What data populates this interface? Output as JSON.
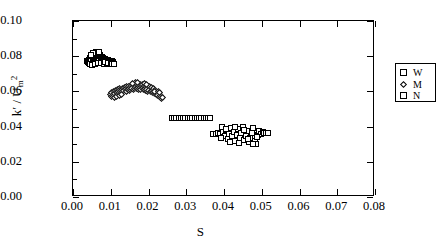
{
  "chart_data": {
    "type": "scatter",
    "title": "",
    "xlabel": "S",
    "ylabel": "k' / U_m^2",
    "ylabel_parts": {
      "symbol": "k",
      "prime": "′",
      "separator": " / ",
      "denom": "U",
      "denom_sub": "m",
      "denom_sup": "2"
    },
    "xlim": [
      0.0,
      0.08
    ],
    "ylim": [
      0.0,
      0.1
    ],
    "xticks": [
      0.0,
      0.01,
      0.02,
      0.03,
      0.04,
      0.05,
      0.06,
      0.07,
      0.08
    ],
    "xtick_labels": [
      "0.00",
      "0.01",
      "0.02",
      "0.03",
      "0.04",
      "0.05",
      "0.06",
      "0.07",
      "0.08"
    ],
    "yticks": [
      0.0,
      0.02,
      0.04,
      0.06,
      0.08,
      0.1
    ],
    "ytick_labels": [
      "0.00",
      "0.02",
      "0.04",
      "0.06",
      "0.08",
      "0.10"
    ],
    "grid": false,
    "legend_position": "upper right",
    "legend": [
      {
        "label": "W",
        "marker": "square"
      },
      {
        "label": "M",
        "marker": "diamond"
      },
      {
        "label": "N",
        "marker": "square"
      }
    ],
    "series": [
      {
        "name": "W",
        "marker": "square",
        "points": [
          [
            0.0038,
            0.0772
          ],
          [
            0.004,
            0.0768
          ],
          [
            0.0042,
            0.078
          ],
          [
            0.0043,
            0.0762
          ],
          [
            0.0045,
            0.0788
          ],
          [
            0.0046,
            0.0775
          ],
          [
            0.0048,
            0.0795
          ],
          [
            0.0049,
            0.0783
          ],
          [
            0.0051,
            0.08
          ],
          [
            0.0052,
            0.079
          ],
          [
            0.0053,
            0.0806
          ],
          [
            0.0055,
            0.0797
          ],
          [
            0.0056,
            0.0812
          ],
          [
            0.0057,
            0.0802
          ],
          [
            0.0059,
            0.0815
          ],
          [
            0.006,
            0.0806
          ],
          [
            0.0061,
            0.0818
          ],
          [
            0.0063,
            0.0809
          ],
          [
            0.0064,
            0.082
          ],
          [
            0.0065,
            0.0812
          ],
          [
            0.0067,
            0.0815
          ],
          [
            0.0068,
            0.0806
          ],
          [
            0.0069,
            0.081
          ],
          [
            0.0071,
            0.08
          ],
          [
            0.0072,
            0.0804
          ],
          [
            0.0073,
            0.0795
          ],
          [
            0.0075,
            0.0798
          ],
          [
            0.0076,
            0.079
          ],
          [
            0.0077,
            0.0793
          ],
          [
            0.0079,
            0.0786
          ],
          [
            0.008,
            0.079
          ],
          [
            0.0081,
            0.0782
          ],
          [
            0.0083,
            0.0786
          ],
          [
            0.0084,
            0.0779
          ],
          [
            0.0085,
            0.0783
          ],
          [
            0.0087,
            0.0776
          ],
          [
            0.0088,
            0.078
          ],
          [
            0.0089,
            0.0773
          ],
          [
            0.0091,
            0.0778
          ],
          [
            0.0092,
            0.0772
          ],
          [
            0.0094,
            0.0776
          ],
          [
            0.0095,
            0.077
          ],
          [
            0.0096,
            0.0775
          ],
          [
            0.0098,
            0.0768
          ],
          [
            0.0099,
            0.0772
          ],
          [
            0.0101,
            0.0766
          ],
          [
            0.0102,
            0.077
          ],
          [
            0.0104,
            0.0764
          ],
          [
            0.0105,
            0.0768
          ],
          [
            0.0107,
            0.0762
          ],
          [
            0.0044,
            0.0756
          ],
          [
            0.005,
            0.0752
          ],
          [
            0.0058,
            0.0758
          ],
          [
            0.0066,
            0.0762
          ],
          [
            0.0074,
            0.076
          ],
          [
            0.0082,
            0.0758
          ],
          [
            0.009,
            0.0756
          ],
          [
            0.0098,
            0.0754
          ],
          [
            0.0106,
            0.0755
          ],
          [
            0.0062,
            0.0826
          ],
          [
            0.007,
            0.0824
          ],
          [
            0.0054,
            0.082
          ],
          [
            0.0047,
            0.0808
          ],
          [
            0.0086,
            0.0768
          ],
          [
            0.0093,
            0.0764
          ],
          [
            0.01,
            0.076
          ],
          [
            0.0103,
            0.0757
          ],
          [
            0.0108,
            0.0758
          ]
        ]
      },
      {
        "name": "M",
        "marker": "diamond",
        "points": [
          [
            0.01,
            0.0585
          ],
          [
            0.0103,
            0.0592
          ],
          [
            0.0106,
            0.06
          ],
          [
            0.0109,
            0.0596
          ],
          [
            0.0112,
            0.0606
          ],
          [
            0.0115,
            0.0601
          ],
          [
            0.0118,
            0.061
          ],
          [
            0.0121,
            0.0605
          ],
          [
            0.0124,
            0.0614
          ],
          [
            0.0127,
            0.0609
          ],
          [
            0.013,
            0.0618
          ],
          [
            0.0133,
            0.0612
          ],
          [
            0.0136,
            0.0622
          ],
          [
            0.0139,
            0.0616
          ],
          [
            0.0142,
            0.0626
          ],
          [
            0.0145,
            0.062
          ],
          [
            0.0148,
            0.063
          ],
          [
            0.0151,
            0.0624
          ],
          [
            0.0154,
            0.0634
          ],
          [
            0.0157,
            0.0628
          ],
          [
            0.016,
            0.0638
          ],
          [
            0.0163,
            0.0632
          ],
          [
            0.0166,
            0.064
          ],
          [
            0.0169,
            0.0634
          ],
          [
            0.0172,
            0.0642
          ],
          [
            0.0175,
            0.0636
          ],
          [
            0.0178,
            0.064
          ],
          [
            0.0181,
            0.0632
          ],
          [
            0.0184,
            0.0638
          ],
          [
            0.0187,
            0.063
          ],
          [
            0.019,
            0.0634
          ],
          [
            0.0193,
            0.0626
          ],
          [
            0.0196,
            0.063
          ],
          [
            0.0199,
            0.0622
          ],
          [
            0.0202,
            0.0626
          ],
          [
            0.0205,
            0.0618
          ],
          [
            0.0208,
            0.062
          ],
          [
            0.0211,
            0.0612
          ],
          [
            0.0214,
            0.0614
          ],
          [
            0.0217,
            0.0606
          ],
          [
            0.022,
            0.0602
          ],
          [
            0.0223,
            0.0594
          ],
          [
            0.0226,
            0.0588
          ],
          [
            0.0229,
            0.058
          ],
          [
            0.0232,
            0.0574
          ],
          [
            0.0235,
            0.0568
          ],
          [
            0.0102,
            0.0572
          ],
          [
            0.0105,
            0.0578
          ],
          [
            0.0108,
            0.0582
          ],
          [
            0.0111,
            0.0588
          ],
          [
            0.0114,
            0.0592
          ],
          [
            0.0117,
            0.0596
          ],
          [
            0.012,
            0.059
          ],
          [
            0.0123,
            0.0596
          ],
          [
            0.0126,
            0.06
          ],
          [
            0.0129,
            0.0604
          ],
          [
            0.0132,
            0.0598
          ],
          [
            0.0135,
            0.0604
          ],
          [
            0.0138,
            0.0608
          ],
          [
            0.0141,
            0.0602
          ],
          [
            0.0144,
            0.0608
          ],
          [
            0.0147,
            0.0612
          ],
          [
            0.015,
            0.0606
          ],
          [
            0.0153,
            0.0612
          ],
          [
            0.0156,
            0.0616
          ],
          [
            0.0159,
            0.061
          ],
          [
            0.0162,
            0.0616
          ],
          [
            0.0165,
            0.062
          ],
          [
            0.0168,
            0.0614
          ],
          [
            0.0171,
            0.0618
          ],
          [
            0.0174,
            0.0612
          ],
          [
            0.0177,
            0.0616
          ],
          [
            0.018,
            0.061
          ],
          [
            0.0183,
            0.0614
          ],
          [
            0.0186,
            0.0608
          ],
          [
            0.0189,
            0.0612
          ],
          [
            0.0192,
            0.0606
          ],
          [
            0.0195,
            0.061
          ],
          [
            0.0198,
            0.0602
          ],
          [
            0.0201,
            0.0606
          ],
          [
            0.0204,
            0.0598
          ],
          [
            0.0207,
            0.06
          ],
          [
            0.021,
            0.0592
          ],
          [
            0.0213,
            0.0594
          ],
          [
            0.0216,
            0.0586
          ],
          [
            0.0219,
            0.0588
          ],
          [
            0.0222,
            0.058
          ],
          [
            0.0225,
            0.0578
          ],
          [
            0.0228,
            0.057
          ],
          [
            0.0231,
            0.0566
          ],
          [
            0.0234,
            0.0562
          ],
          [
            0.0237,
            0.0566
          ],
          [
            0.0165,
            0.0648
          ],
          [
            0.0172,
            0.065
          ],
          [
            0.0158,
            0.0644
          ],
          [
            0.019,
            0.0644
          ],
          [
            0.0196,
            0.064
          ],
          [
            0.0216,
            0.0598
          ],
          [
            0.0226,
            0.06
          ],
          [
            0.023,
            0.0592
          ],
          [
            0.011,
            0.0566
          ],
          [
            0.0116,
            0.057
          ],
          [
            0.0122,
            0.0576
          ],
          [
            0.0128,
            0.0582
          ]
        ]
      },
      {
        "name": "N",
        "marker": "square",
        "points": [
          [
            0.0262,
            0.045
          ],
          [
            0.0268,
            0.045
          ],
          [
            0.0274,
            0.045
          ],
          [
            0.028,
            0.045
          ],
          [
            0.0286,
            0.045
          ],
          [
            0.0292,
            0.045
          ],
          [
            0.0298,
            0.045
          ],
          [
            0.0304,
            0.045
          ],
          [
            0.031,
            0.045
          ],
          [
            0.0316,
            0.045
          ],
          [
            0.0322,
            0.045
          ],
          [
            0.0328,
            0.045
          ],
          [
            0.0334,
            0.045
          ],
          [
            0.034,
            0.045
          ],
          [
            0.0346,
            0.045
          ],
          [
            0.0352,
            0.045
          ],
          [
            0.0358,
            0.0448
          ],
          [
            0.0364,
            0.0448
          ],
          [
            0.0372,
            0.036
          ],
          [
            0.0378,
            0.0358
          ],
          [
            0.0384,
            0.0362
          ],
          [
            0.039,
            0.0356
          ],
          [
            0.0396,
            0.04
          ],
          [
            0.0398,
            0.0368
          ],
          [
            0.0402,
            0.0346
          ],
          [
            0.0406,
            0.0378
          ],
          [
            0.041,
            0.033
          ],
          [
            0.0414,
            0.0358
          ],
          [
            0.0418,
            0.039
          ],
          [
            0.0422,
            0.0344
          ],
          [
            0.0426,
            0.037
          ],
          [
            0.043,
            0.0318
          ],
          [
            0.0434,
            0.0352
          ],
          [
            0.0438,
            0.0384
          ],
          [
            0.0442,
            0.0336
          ],
          [
            0.0446,
            0.0362
          ],
          [
            0.045,
            0.0396
          ],
          [
            0.0454,
            0.0324
          ],
          [
            0.0458,
            0.0348
          ],
          [
            0.0462,
            0.0374
          ],
          [
            0.0466,
            0.031
          ],
          [
            0.047,
            0.0338
          ],
          [
            0.0474,
            0.0366
          ],
          [
            0.0478,
            0.0392
          ],
          [
            0.0482,
            0.032
          ],
          [
            0.0486,
            0.03
          ],
          [
            0.049,
            0.0352
          ],
          [
            0.0494,
            0.0374
          ],
          [
            0.0498,
            0.036
          ],
          [
            0.0502,
            0.0368
          ],
          [
            0.0506,
            0.0364
          ],
          [
            0.051,
            0.0366
          ],
          [
            0.0516,
            0.0362
          ],
          [
            0.0392,
            0.0338
          ],
          [
            0.0404,
            0.0388
          ],
          [
            0.0416,
            0.0312
          ],
          [
            0.0428,
            0.0398
          ],
          [
            0.044,
            0.0306
          ],
          [
            0.0452,
            0.038
          ],
          [
            0.0464,
            0.0332
          ],
          [
            0.0476,
            0.0302
          ],
          [
            0.0488,
            0.0342
          ]
        ]
      }
    ]
  }
}
